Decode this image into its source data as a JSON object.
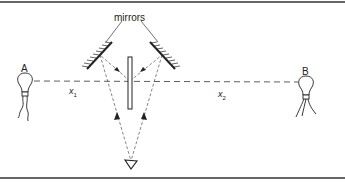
{
  "diagram": {
    "labels": {
      "mirrors": "mirrors",
      "source_a": "A",
      "source_b": "B",
      "distance_1_var": "x",
      "distance_1_sub": "1",
      "distance_2_var": "x",
      "distance_2_sub": "2"
    },
    "colors": {
      "line": "#222222",
      "border": "#333333",
      "background": "#ffffff"
    }
  }
}
